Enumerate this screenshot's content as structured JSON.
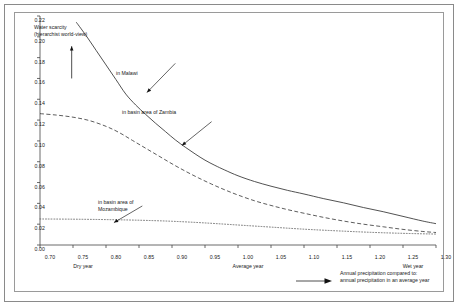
{
  "chart_data": {
    "type": "line",
    "title": "",
    "xlabel": "Annual precipitation compared to annual precipitation in an average year",
    "ylabel": "",
    "xlim": [
      0.7,
      1.3
    ],
    "ylim": [
      0.0,
      0.22
    ],
    "grid": false,
    "legend_position": "inline-annotations",
    "x_ticks": [
      "0.70",
      "0.75",
      "0.80",
      "0.85",
      "0.90",
      "0.95",
      "1.00",
      "1.05",
      "1.10",
      "1.15",
      "1.20",
      "1.25",
      "1.30"
    ],
    "x_tick_values": [
      0.7,
      0.75,
      0.8,
      0.85,
      0.9,
      0.95,
      1.0,
      1.05,
      1.1,
      1.15,
      1.2,
      1.25,
      1.3
    ],
    "y_ticks": [
      "0.00",
      "0.02",
      "0.04",
      "0.06",
      "0.08",
      "0.10",
      "0.12",
      "0.14",
      "0.16",
      "0.18",
      "0.20",
      "0.22"
    ],
    "y_tick_values": [
      0.0,
      0.02,
      0.04,
      0.06,
      0.08,
      0.1,
      0.12,
      0.14,
      0.16,
      0.18,
      0.2,
      0.22
    ],
    "x_annotations": [
      {
        "label": "Dry year",
        "at": 0.75
      },
      {
        "label": "Average year",
        "at": 1.0
      },
      {
        "label": "Wet year",
        "at": 1.25
      }
    ],
    "series": [
      {
        "name": "in Malawi",
        "style": "solid",
        "color": "#333333",
        "x": [
          0.755,
          0.77,
          0.785,
          0.8,
          0.815,
          0.83,
          0.845,
          0.86,
          0.875,
          0.89,
          0.905,
          0.92,
          0.935,
          0.95,
          0.965,
          0.98,
          1.0,
          1.025,
          1.05,
          1.075,
          1.1,
          1.13,
          1.16,
          1.19,
          1.22,
          1.25,
          1.28,
          1.3
        ],
        "values": [
          0.214,
          0.201,
          0.187,
          0.173,
          0.159,
          0.145,
          0.1345,
          0.1255,
          0.117,
          0.109,
          0.101,
          0.094,
          0.0875,
          0.0815,
          0.0765,
          0.072,
          0.0665,
          0.061,
          0.0565,
          0.0525,
          0.049,
          0.0445,
          0.0405,
          0.036,
          0.032,
          0.0275,
          0.023,
          0.0205
        ]
      },
      {
        "name": "in basin area of Zambia",
        "style": "dashed",
        "color": "#333333",
        "x": [
          0.7,
          0.725,
          0.75,
          0.775,
          0.8,
          0.82,
          0.84,
          0.86,
          0.88,
          0.9,
          0.92,
          0.94,
          0.96,
          0.98,
          1.0,
          1.025,
          1.05,
          1.075,
          1.1,
          1.13,
          1.16,
          1.19,
          1.22,
          1.25,
          1.28,
          1.3
        ],
        "values": [
          0.1262,
          0.1248,
          0.1228,
          0.1195,
          0.114,
          0.108,
          0.1005,
          0.093,
          0.0855,
          0.078,
          0.071,
          0.0645,
          0.0585,
          0.053,
          0.048,
          0.0425,
          0.038,
          0.034,
          0.0305,
          0.0265,
          0.023,
          0.02,
          0.0175,
          0.015,
          0.013,
          0.012
        ]
      },
      {
        "name": "in basin area of Mozambique",
        "style": "dotted",
        "color": "#555555",
        "x": [
          0.7,
          0.75,
          0.8,
          0.85,
          0.9,
          0.95,
          1.0,
          1.05,
          1.1,
          1.15,
          1.2,
          1.25,
          1.3
        ],
        "values": [
          0.025,
          0.0248,
          0.0244,
          0.0238,
          0.0228,
          0.0212,
          0.0192,
          0.0172,
          0.0152,
          0.0136,
          0.0122,
          0.0112,
          0.0105
        ]
      }
    ],
    "annotations": [
      {
        "name": "water-scarcity-note",
        "text": "Water scarcity\n(hierarchist world-view)",
        "arrow": "up"
      },
      {
        "name": "malawi-label",
        "text": "in Malawi",
        "arrow": "down-left"
      },
      {
        "name": "zambia-label",
        "text": "in basin area of Zambia",
        "arrow": "down-left"
      },
      {
        "name": "mozambique-label",
        "text": "in basin area of\nMozambique",
        "arrow": "down-left"
      }
    ],
    "caption": "Annual precipitation compared to:\nannual precipitation in an average year"
  },
  "colors": {
    "frame": "#8a8a8a",
    "plot_border": "#9a9a9a",
    "axis": "#444444",
    "text": "#1a1a1a",
    "background": "#ffffff"
  }
}
